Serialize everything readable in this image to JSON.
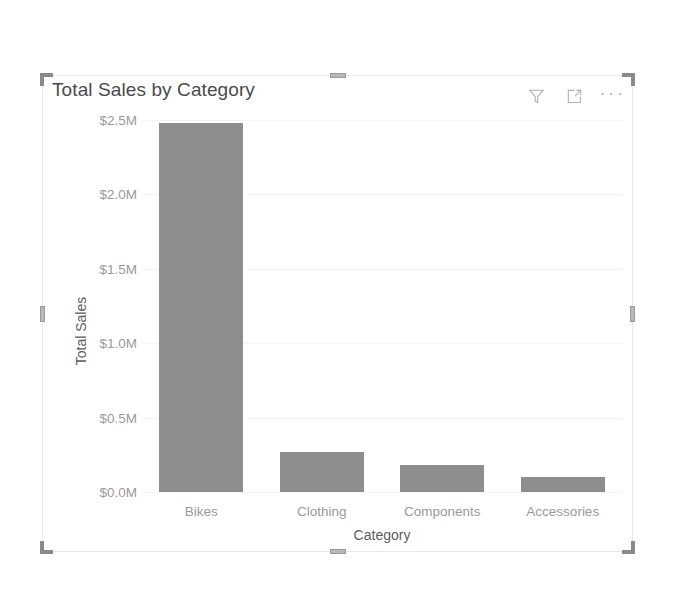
{
  "visual": {
    "title": "Total Sales by Category",
    "header_icons": [
      {
        "name": "filter-icon",
        "label": "Filters"
      },
      {
        "name": "focus-mode-icon",
        "label": "Focus mode"
      },
      {
        "name": "more-options-icon",
        "label": "More options"
      }
    ],
    "more_options_glyph": "···",
    "selection_handles": [
      "handle-top-left",
      "handle-top-center",
      "handle-top-right",
      "handle-middle-left",
      "handle-middle-right",
      "handle-bottom-left",
      "handle-bottom-center",
      "handle-bottom-right"
    ]
  },
  "colors": {
    "bar": "#8e8e8e",
    "title_text": "#4a4a4a",
    "axis_text": "#9a9a9a",
    "axis_title_text": "#5c5c5c",
    "gridline": "#f4f4f4",
    "visual_border": "#e8e8e8",
    "handle": "#8a8a8a",
    "background": "#ffffff"
  },
  "chart_data": {
    "type": "bar",
    "title": "Total Sales by Category",
    "xlabel": "Category",
    "ylabel": "Total Sales",
    "categories": [
      "Bikes",
      "Clothing",
      "Components",
      "Accessories"
    ],
    "values": [
      2.48,
      0.27,
      0.18,
      0.1
    ],
    "value_unit": "millions of dollars",
    "ylim": [
      0,
      2.5
    ],
    "yticks": [
      0,
      0.5,
      1.0,
      1.5,
      2.0,
      2.5
    ],
    "ytick_labels": [
      "$0.0M",
      "$0.5M",
      "$1.0M",
      "$1.5M",
      "$2.0M",
      "$2.5M"
    ],
    "grid": true,
    "legend": "none",
    "orientation": "vertical"
  }
}
